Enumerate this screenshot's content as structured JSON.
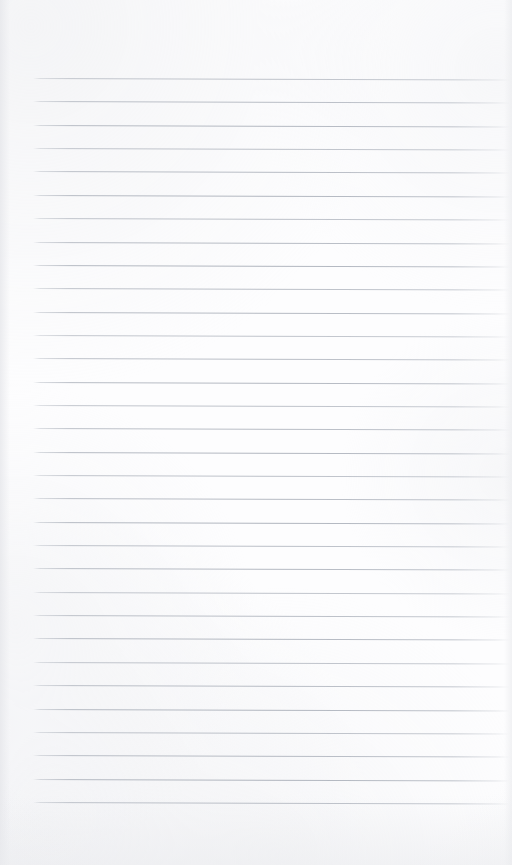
{
  "document": {
    "kind": "scanned-lined-paper",
    "title": "Blank Ruled Notebook Page",
    "content_text": "",
    "page_width": 512,
    "page_height": 865,
    "has_handwriting": false,
    "has_printed_text": false,
    "is_blank": true
  },
  "paper": {
    "background_color": "#fdfdfe",
    "edge_tint_color": "#e9eaed",
    "margin_left": 33,
    "margin_right": 510,
    "bottom_blank_area_px": 60
  },
  "ruling": {
    "style": "wide-ruled-horizontal",
    "line_color": "#b0b5be",
    "line_thickness_px": 1,
    "line_count": 32,
    "first_line_y": 78,
    "line_spacing_px": 23.35,
    "line_start_x": 33,
    "line_end_x": 510,
    "skew_drop_px": 1.6,
    "has_vertical_margin_rule": false,
    "line_y_positions": [
      78.0,
      101.4,
      124.7,
      148.1,
      171.4,
      194.8,
      218.1,
      241.5,
      264.8,
      288.2,
      311.5,
      334.9,
      358.2,
      381.6,
      404.9,
      428.3,
      451.6,
      475.0,
      498.3,
      521.7,
      545.0,
      568.4,
      591.7,
      615.1,
      638.4,
      661.8,
      685.1,
      708.5,
      731.8,
      755.2,
      778.5,
      801.9
    ]
  }
}
